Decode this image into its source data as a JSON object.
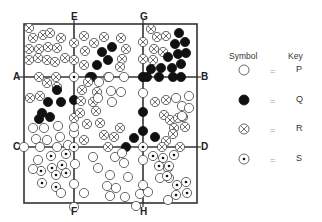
{
  "labels": {
    "top": [
      {
        "text": "E",
        "x": 74
      },
      {
        "text": "G",
        "x": 143
      }
    ],
    "bottom": [
      {
        "text": "F",
        "x": 74
      },
      {
        "text": "H",
        "x": 143
      }
    ],
    "left": [
      {
        "text": "A",
        "y": 77
      },
      {
        "text": "C",
        "y": 147
      }
    ],
    "right": [
      {
        "text": "B",
        "y": 77
      },
      {
        "text": "D",
        "y": 147
      }
    ]
  },
  "legend": {
    "symbol_header": "Symbol",
    "key_header": "Key",
    "rows": [
      {
        "symbol": "open-circle",
        "equals": "=",
        "key": "P"
      },
      {
        "symbol": "filled-circle",
        "equals": "=",
        "key": "Q"
      },
      {
        "symbol": "crossed-circle",
        "equals": "=",
        "key": "R"
      },
      {
        "symbol": "dotted-circle",
        "equals": "=",
        "key": "S"
      }
    ]
  },
  "grid": {
    "left": 24,
    "top": 24,
    "right": 197,
    "bottom": 203,
    "v_lines": [
      74,
      143
    ],
    "h_lines": [
      77,
      147
    ]
  },
  "symbols": [
    [
      "R",
      29,
      28
    ],
    [
      "R",
      33,
      38
    ],
    [
      "R",
      43,
      35
    ],
    [
      "R",
      50,
      33
    ],
    [
      "R",
      61,
      38
    ],
    [
      "R",
      29,
      49
    ],
    [
      "R",
      39,
      49
    ],
    [
      "R",
      48,
      47
    ],
    [
      "R",
      57,
      48
    ],
    [
      "R",
      29,
      60
    ],
    [
      "R",
      38,
      58
    ],
    [
      "R",
      47,
      60
    ],
    [
      "R",
      55,
      62
    ],
    [
      "R",
      65,
      58
    ],
    [
      "R",
      74,
      43
    ],
    [
      "R",
      74,
      60
    ],
    [
      "R",
      39,
      77
    ],
    [
      "R",
      56,
      77
    ],
    [
      "R",
      84,
      36
    ],
    [
      "R",
      94,
      43
    ],
    [
      "R",
      85,
      51
    ],
    [
      "R",
      104,
      37
    ],
    [
      "R",
      121,
      38
    ],
    [
      "R",
      126,
      49
    ],
    [
      "R",
      122,
      59
    ],
    [
      "R",
      84,
      65
    ],
    [
      "R",
      120,
      67
    ],
    [
      "R",
      108,
      77
    ],
    [
      "R",
      143,
      42
    ],
    [
      "R",
      143,
      59
    ],
    [
      "Q",
      102,
      52
    ],
    [
      "Q",
      108,
      60
    ],
    [
      "Q",
      97,
      65
    ],
    [
      "Q",
      90,
      77
    ],
    [
      "Q",
      112,
      47
    ],
    [
      "R",
      151,
      29
    ],
    [
      "R",
      157,
      37
    ],
    [
      "R",
      166,
      36
    ],
    [
      "R",
      154,
      49
    ],
    [
      "R",
      163,
      52
    ],
    [
      "R",
      153,
      60
    ],
    [
      "Q",
      179,
      33
    ],
    [
      "Q",
      175,
      44
    ],
    [
      "Q",
      185,
      42
    ],
    [
      "Q",
      168,
      57
    ],
    [
      "Q",
      178,
      54
    ],
    [
      "Q",
      186,
      53
    ],
    [
      "Q",
      161,
      68
    ],
    [
      "Q",
      172,
      68
    ],
    [
      "Q",
      181,
      64
    ],
    [
      "Q",
      151,
      69
    ],
    [
      "Q",
      159,
      77
    ],
    [
      "Q",
      173,
      77
    ],
    [
      "Q",
      181,
      77
    ],
    [
      "P",
      124,
      77
    ],
    [
      "S",
      74,
      77
    ],
    [
      "S",
      143,
      77
    ],
    [
      "R",
      30,
      98
    ],
    [
      "R",
      40,
      96
    ],
    [
      "R",
      47,
      83
    ],
    [
      "R",
      57,
      87
    ],
    [
      "R",
      74,
      118
    ],
    [
      "Q",
      57,
      90
    ],
    [
      "Q",
      48,
      102
    ],
    [
      "Q",
      61,
      102
    ],
    [
      "Q",
      42,
      113
    ],
    [
      "Q",
      39,
      119
    ],
    [
      "Q",
      50,
      117
    ],
    [
      "Q",
      74,
      100
    ],
    [
      "Q",
      92,
      77
    ],
    [
      "P",
      33,
      128
    ],
    [
      "P",
      44,
      128
    ],
    [
      "P",
      58,
      126
    ],
    [
      "P",
      36,
      139
    ],
    [
      "P",
      47,
      140
    ],
    [
      "P",
      60,
      137
    ],
    [
      "P",
      68,
      145
    ],
    [
      "P",
      74,
      133
    ],
    [
      "R",
      82,
      90
    ],
    [
      "R",
      88,
      82
    ],
    [
      "R",
      81,
      101
    ],
    [
      "R",
      97,
      92
    ],
    [
      "R",
      93,
      102
    ],
    [
      "R",
      80,
      113
    ],
    [
      "R",
      96,
      111
    ],
    [
      "R",
      87,
      124
    ],
    [
      "R",
      100,
      123
    ],
    [
      "R",
      120,
      128
    ],
    [
      "R",
      114,
      137
    ],
    [
      "R",
      84,
      140
    ],
    [
      "R",
      104,
      135
    ],
    [
      "P",
      99,
      82
    ],
    [
      "P",
      111,
      91
    ],
    [
      "P",
      112,
      102
    ],
    [
      "P",
      121,
      92
    ],
    [
      "P",
      98,
      98
    ],
    [
      "P",
      109,
      77
    ],
    [
      "P",
      74,
      127
    ],
    [
      "P",
      143,
      93
    ],
    [
      "Q",
      143,
      112
    ],
    [
      "Q",
      143,
      131
    ],
    [
      "Q",
      134,
      138
    ],
    [
      "Q",
      155,
      137
    ],
    [
      "Q",
      143,
      77
    ],
    [
      "Q",
      147,
      77
    ],
    [
      "R",
      155,
      102
    ],
    [
      "R",
      166,
      100
    ],
    [
      "R",
      164,
      115
    ],
    [
      "R",
      170,
      120
    ],
    [
      "R",
      174,
      128
    ],
    [
      "R",
      178,
      118
    ],
    [
      "R",
      183,
      117
    ],
    [
      "R",
      185,
      127
    ],
    [
      "R",
      173,
      134
    ],
    [
      "R",
      166,
      141
    ],
    [
      "P",
      176,
      98
    ],
    [
      "P",
      182,
      106
    ],
    [
      "P",
      189,
      96
    ],
    [
      "P",
      182,
      116
    ],
    [
      "P",
      189,
      108
    ],
    [
      "P",
      40,
      147
    ],
    [
      "P",
      57,
      147
    ],
    [
      "P",
      24,
      147
    ],
    [
      "Q",
      126,
      147
    ],
    [
      "R",
      108,
      147
    ],
    [
      "R",
      162,
      147
    ],
    [
      "R",
      180,
      147
    ],
    [
      "S",
      74,
      147
    ],
    [
      "S",
      143,
      147
    ],
    [
      "S",
      51,
      156
    ],
    [
      "S",
      66,
      154
    ],
    [
      "S",
      41,
      171
    ],
    [
      "S",
      52,
      168
    ],
    [
      "S",
      62,
      165
    ],
    [
      "S",
      56,
      175
    ],
    [
      "S",
      66,
      173
    ],
    [
      "S",
      42,
      183
    ],
    [
      "S",
      56,
      187
    ],
    [
      "P",
      33,
      169
    ],
    [
      "P",
      38,
      160
    ],
    [
      "P",
      61,
      193
    ],
    [
      "P",
      75,
      164
    ],
    [
      "P",
      74,
      184
    ],
    [
      "P",
      84,
      193
    ],
    [
      "P",
      93,
      157
    ],
    [
      "P",
      98,
      168
    ],
    [
      "P",
      115,
      157
    ],
    [
      "P",
      122,
      153
    ],
    [
      "P",
      124,
      163
    ],
    [
      "P",
      110,
      175
    ],
    [
      "P",
      107,
      186
    ],
    [
      "P",
      116,
      188
    ],
    [
      "P",
      110,
      196
    ],
    [
      "P",
      125,
      197
    ],
    [
      "P",
      128,
      177
    ],
    [
      "P",
      140,
      194
    ],
    [
      "P",
      148,
      192
    ],
    [
      "P",
      136,
      206
    ],
    [
      "P",
      143,
      160
    ],
    [
      "P",
      143,
      185
    ],
    [
      "P",
      168,
      200
    ],
    [
      "P",
      160,
      178
    ],
    [
      "P",
      168,
      168
    ],
    [
      "P",
      169,
      178
    ],
    [
      "S",
      153,
      156
    ],
    [
      "S",
      163,
      158
    ],
    [
      "S",
      174,
      155
    ],
    [
      "S",
      159,
      166
    ],
    [
      "S",
      169,
      166
    ],
    [
      "S",
      167,
      176
    ],
    [
      "S",
      177,
      185
    ],
    [
      "S",
      186,
      182
    ],
    [
      "S",
      187,
      193
    ],
    [
      "S",
      176,
      195
    ],
    [
      "P",
      74,
      207
    ]
  ]
}
